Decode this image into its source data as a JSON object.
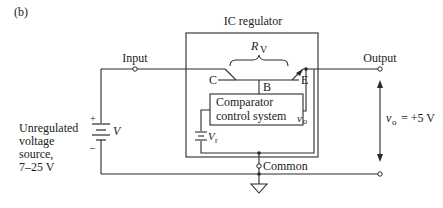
{
  "figure_label": "(b)",
  "ic_title": "IC regulator",
  "terminals": {
    "input": "Input",
    "output": "Output",
    "common": "Common"
  },
  "transistor": {
    "collector": "C",
    "base": "B",
    "emitter": "E",
    "resistance_symbol": "R",
    "resistance_subscript": "V"
  },
  "comparator": {
    "line1": "Comparator",
    "line2": "control system",
    "output_symbol": "v",
    "output_subscript": "o"
  },
  "reference": {
    "symbol": "V",
    "subscript": "r"
  },
  "source": {
    "label_lines": [
      "Unregulated",
      "voltage",
      "source,",
      "7–25 V"
    ],
    "battery_symbol": "V",
    "plus": "+",
    "minus": "–"
  },
  "output_voltage": {
    "symbol": "v",
    "subscript": "o",
    "value": " = +5 V"
  }
}
